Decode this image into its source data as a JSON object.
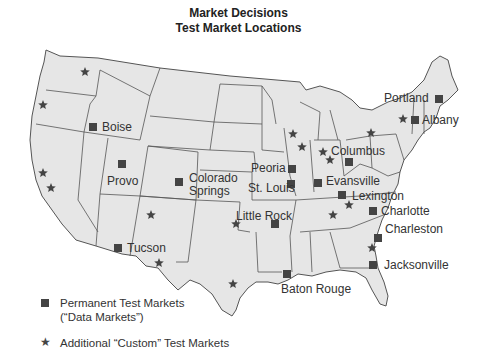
{
  "title": {
    "line1": "Market Decisions",
    "line2": "Test Market Locations"
  },
  "colors": {
    "state_fill": "#e6e6e6",
    "state_stroke": "#555555",
    "marker": "#444444",
    "background": "#ffffff"
  },
  "markers": {
    "permanent": [
      {
        "name": "Boise",
        "label": "Boise",
        "x": 93,
        "y": 127,
        "lx": 102,
        "ly": 121
      },
      {
        "name": "Provo",
        "label": "Provo",
        "x": 122,
        "y": 164,
        "lx": 107,
        "ly": 175
      },
      {
        "name": "Colorado Springs",
        "label": "Colorado\nSprings",
        "x": 179,
        "y": 182,
        "lx": 189,
        "ly": 172
      },
      {
        "name": "Tucson",
        "label": "Tucson",
        "x": 118,
        "y": 248,
        "lx": 127,
        "ly": 242
      },
      {
        "name": "Peoria",
        "label": "Peoria",
        "x": 292,
        "y": 169,
        "lx": 251,
        "ly": 162
      },
      {
        "name": "St. Louis",
        "label": "St. Louis",
        "x": 291,
        "y": 184,
        "lx": 248,
        "ly": 182
      },
      {
        "name": "Little Rock",
        "label": "Little Rock",
        "x": 275,
        "y": 224,
        "lx": 236,
        "ly": 210
      },
      {
        "name": "Evansville",
        "label": "Evansville",
        "x": 318,
        "y": 183,
        "lx": 326,
        "ly": 175
      },
      {
        "name": "Columbus",
        "label": "Columbus",
        "x": 349,
        "y": 162,
        "lx": 331,
        "ly": 145
      },
      {
        "name": "Lexington",
        "label": "Lexington",
        "x": 342,
        "y": 195,
        "lx": 352,
        "ly": 190
      },
      {
        "name": "Charlotte",
        "label": "Charlotte",
        "x": 373,
        "y": 211,
        "lx": 381,
        "ly": 205
      },
      {
        "name": "Charleston",
        "label": "Charleston",
        "x": 378,
        "y": 238,
        "lx": 385,
        "ly": 223
      },
      {
        "name": "Jacksonville",
        "label": "Jacksonville",
        "x": 373,
        "y": 265,
        "lx": 384,
        "ly": 259
      },
      {
        "name": "Baton Rouge",
        "label": "Baton Rouge",
        "x": 287,
        "y": 274,
        "lx": 281,
        "ly": 283
      },
      {
        "name": "Albany",
        "label": "Albany",
        "x": 415,
        "y": 120,
        "lx": 422,
        "ly": 114
      },
      {
        "name": "Portland",
        "label": "Portland",
        "x": 439,
        "y": 99,
        "lx": 384,
        "ly": 92
      }
    ],
    "custom": [
      {
        "x": 85,
        "y": 72
      },
      {
        "x": 43,
        "y": 105
      },
      {
        "x": 43,
        "y": 173
      },
      {
        "x": 51,
        "y": 188
      },
      {
        "x": 151,
        "y": 215
      },
      {
        "x": 159,
        "y": 263
      },
      {
        "x": 236,
        "y": 224
      },
      {
        "x": 233,
        "y": 284
      },
      {
        "x": 293,
        "y": 134
      },
      {
        "x": 302,
        "y": 147
      },
      {
        "x": 323,
        "y": 152
      },
      {
        "x": 330,
        "y": 160
      },
      {
        "x": 371,
        "y": 133
      },
      {
        "x": 403,
        "y": 119
      },
      {
        "x": 333,
        "y": 215
      },
      {
        "x": 349,
        "y": 205
      },
      {
        "x": 372,
        "y": 248
      }
    ]
  },
  "legend": {
    "permanent_line1": "Permanent Test Markets",
    "permanent_line2": "(“Data Markets”)",
    "custom": "Additional “Custom” Test Markets"
  }
}
